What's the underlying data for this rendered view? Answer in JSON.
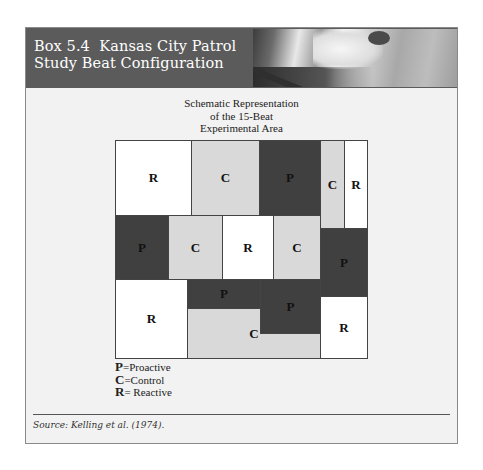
{
  "header": {
    "title_line1": "Box 5.4  Kansas City Patrol",
    "title_line2": "Study Beat Configuration",
    "photo": "decorative-photo"
  },
  "diagram": {
    "title_line1": "Schematic Representation",
    "title_line2": "of the 15-Beat",
    "title_line3": "Experimental Area",
    "colors": {
      "P": "#404040",
      "C": "#d9d9d9",
      "R": "#ffffff",
      "border": "#444444"
    },
    "beats": [
      {
        "label": "R",
        "type": "Reactive",
        "x": 0,
        "y": 0,
        "w": 77,
        "h": 76
      },
      {
        "label": "C",
        "type": "Control",
        "x": 76,
        "y": 0,
        "w": 69,
        "h": 76
      },
      {
        "label": "P",
        "type": "Proactive",
        "x": 144,
        "y": 0,
        "w": 62,
        "h": 76
      },
      {
        "label": "C",
        "type": "Control",
        "x": 205,
        "y": 0,
        "w": 25,
        "h": 89
      },
      {
        "label": "R",
        "type": "Reactive",
        "x": 229,
        "y": 0,
        "w": 24,
        "h": 89
      },
      {
        "label": "P",
        "type": "Proactive",
        "x": 0,
        "y": 75,
        "w": 54,
        "h": 65
      },
      {
        "label": "C",
        "type": "Control",
        "x": 53,
        "y": 75,
        "w": 55,
        "h": 65
      },
      {
        "label": "R",
        "type": "Reactive",
        "x": 107,
        "y": 75,
        "w": 52,
        "h": 65
      },
      {
        "label": "C",
        "type": "Control",
        "x": 158,
        "y": 75,
        "w": 48,
        "h": 65
      },
      {
        "label": "P",
        "type": "Proactive",
        "x": 205,
        "y": 88,
        "w": 48,
        "h": 69
      },
      {
        "label": "R",
        "type": "Reactive",
        "x": 0,
        "y": 139,
        "w": 73,
        "h": 80
      },
      {
        "label": "C",
        "type": "Control",
        "x": 72,
        "y": 168,
        "w": 134,
        "h": 51
      },
      {
        "label": "P",
        "type": "Proactive",
        "x": 72,
        "y": 139,
        "w": 74,
        "h": 30
      },
      {
        "label": "P",
        "type": "Proactive",
        "x": 145,
        "y": 139,
        "w": 61,
        "h": 55
      },
      {
        "label": "R",
        "type": "Reactive",
        "x": 205,
        "y": 156,
        "w": 48,
        "h": 63
      }
    ]
  },
  "legend": [
    {
      "key": "P",
      "text": "=Proactive"
    },
    {
      "key": "C",
      "text": "=Control"
    },
    {
      "key": "R",
      "text": "= Reactive"
    }
  ],
  "footer": {
    "source": "Source: Kelling et al. (1974)."
  }
}
